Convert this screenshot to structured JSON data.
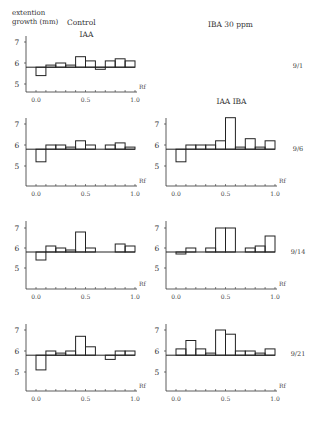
{
  "chart_data": [
    {
      "type": "bar",
      "subtype": "step-histogram",
      "panel": "Control IAA 9/1",
      "column": "Control",
      "title": "IAA",
      "date": "9/1",
      "xlabel": "Rf",
      "ylabel": "extention growth (mm)",
      "x_ticks": [
        "0.0",
        "0.5",
        "1.0"
      ],
      "y_ticks": [
        "5",
        "6",
        "7"
      ],
      "xlim": [
        0,
        1.0
      ],
      "ylim": [
        4,
        7.3
      ],
      "baseline": 5.8,
      "bin_edges": [
        0.0,
        0.1,
        0.2,
        0.3,
        0.4,
        0.5,
        0.6,
        0.7,
        0.8,
        0.9,
        1.0
      ],
      "values": [
        5.4,
        5.9,
        6.0,
        5.9,
        6.3,
        6.1,
        5.7,
        6.1,
        6.2,
        6.1
      ]
    },
    {
      "type": "bar",
      "subtype": "step-histogram",
      "panel": "Control 9/6",
      "column": "Control",
      "title": "",
      "date": "9/6",
      "xlabel": "Rf",
      "x_ticks": [
        "0.0",
        "0.5",
        "1.0"
      ],
      "y_ticks": [
        "5",
        "6",
        "7"
      ],
      "xlim": [
        0,
        1.0
      ],
      "ylim": [
        4,
        7.3
      ],
      "baseline": 5.8,
      "bin_edges": [
        0.0,
        0.1,
        0.2,
        0.3,
        0.4,
        0.5,
        0.6,
        0.7,
        0.8,
        0.9,
        1.0
      ],
      "values": [
        5.2,
        6.0,
        6.0,
        5.9,
        6.2,
        6.0,
        5.8,
        6.0,
        6.1,
        5.9
      ]
    },
    {
      "type": "bar",
      "subtype": "step-histogram",
      "panel": "IAA IBA 9/6",
      "column": "IBA 30ppm",
      "title": "IAA  IBA",
      "date": "9/6",
      "xlabel": "Rf",
      "x_ticks": [
        "0.0",
        "0.5",
        "1.0"
      ],
      "y_ticks": [
        "5",
        "6",
        "7"
      ],
      "xlim": [
        0,
        1.0
      ],
      "ylim": [
        4,
        7.3
      ],
      "baseline": 5.8,
      "bin_edges": [
        0.0,
        0.1,
        0.2,
        0.3,
        0.4,
        0.5,
        0.6,
        0.7,
        0.8,
        0.9,
        1.0
      ],
      "values": [
        5.2,
        6.0,
        6.0,
        6.0,
        6.2,
        7.3,
        5.9,
        6.3,
        5.9,
        6.2
      ]
    },
    {
      "type": "bar",
      "subtype": "step-histogram",
      "panel": "Control 9/14",
      "column": "Control",
      "title": "",
      "date": "9/14",
      "xlabel": "Rf",
      "x_ticks": [
        "0.0",
        "0.5",
        "1.0"
      ],
      "y_ticks": [
        "5",
        "6",
        "7"
      ],
      "xlim": [
        0,
        1.0
      ],
      "ylim": [
        4,
        7.3
      ],
      "baseline": 5.8,
      "bin_edges": [
        0.0,
        0.1,
        0.2,
        0.3,
        0.4,
        0.5,
        0.6,
        0.7,
        0.8,
        0.9,
        1.0
      ],
      "values": [
        5.4,
        6.1,
        6.0,
        5.9,
        6.8,
        6.0,
        5.8,
        5.8,
        6.2,
        6.1
      ]
    },
    {
      "type": "bar",
      "subtype": "step-histogram",
      "panel": "IBA 9/14",
      "column": "IBA 30ppm",
      "title": "",
      "date": "9/14",
      "xlabel": "Rf",
      "x_ticks": [
        "0.0",
        "0.5",
        "1.0"
      ],
      "y_ticks": [
        "5",
        "6",
        "7"
      ],
      "xlim": [
        0,
        1.0
      ],
      "ylim": [
        4,
        7.3
      ],
      "baseline": 5.8,
      "bin_edges": [
        0.0,
        0.1,
        0.2,
        0.3,
        0.4,
        0.5,
        0.6,
        0.7,
        0.8,
        0.9,
        1.0
      ],
      "values": [
        5.7,
        6.0,
        5.8,
        6.0,
        7.0,
        7.0,
        5.8,
        6.0,
        6.1,
        6.6
      ]
    },
    {
      "type": "bar",
      "subtype": "step-histogram",
      "panel": "Control 9/21",
      "column": "Control",
      "title": "",
      "date": "9/21",
      "xlabel": "Rf",
      "x_ticks": [
        "0.0",
        "0.5",
        "1.0"
      ],
      "y_ticks": [
        "5",
        "6",
        "7"
      ],
      "xlim": [
        0,
        1.0
      ],
      "ylim": [
        4,
        7.3
      ],
      "baseline": 5.8,
      "bin_edges": [
        0.0,
        0.1,
        0.2,
        0.3,
        0.4,
        0.5,
        0.6,
        0.7,
        0.8,
        0.9,
        1.0
      ],
      "values": [
        5.1,
        6.0,
        5.9,
        6.0,
        6.7,
        6.2,
        5.8,
        5.6,
        6.0,
        6.0
      ]
    },
    {
      "type": "bar",
      "subtype": "step-histogram",
      "panel": "IBA 9/21",
      "column": "IBA 30ppm",
      "title": "",
      "date": "9/21",
      "xlabel": "Rf",
      "x_ticks": [
        "0.0",
        "0.5",
        "1.0"
      ],
      "y_ticks": [
        "5",
        "6",
        "7"
      ],
      "xlim": [
        0,
        1.0
      ],
      "ylim": [
        4,
        7.3
      ],
      "baseline": 5.8,
      "bin_edges": [
        0.0,
        0.1,
        0.2,
        0.3,
        0.4,
        0.5,
        0.6,
        0.7,
        0.8,
        0.9,
        1.0
      ],
      "values": [
        6.1,
        6.5,
        6.1,
        5.9,
        7.0,
        6.8,
        6.0,
        6.0,
        5.9,
        6.1
      ]
    }
  ],
  "labels": {
    "ylabel_line1": "extention",
    "ylabel_line2": "growth (mm)",
    "col_control": "Control",
    "col_iba": "IBA  30 ppm"
  }
}
